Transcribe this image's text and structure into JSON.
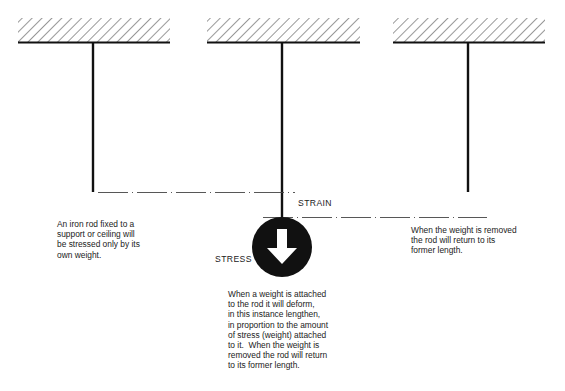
{
  "figure": {
    "panels": [
      {
        "id": "unloaded",
        "caption": "An iron rod fixed to a\nsupport or ceiling will\nbe stressed only by its\nown weight."
      },
      {
        "id": "loaded",
        "caption": "When a weight is attached\nto the rod it will deform,\nin this instance lengthen,\nin proportion to the amount\nof stress (weight) attached\nto it.  When the weight is\nremoved the rod will return\nto its former length."
      },
      {
        "id": "unloaded-after",
        "caption": "When the weight is removed\nthe rod will return to its\nformer length."
      }
    ],
    "labels": {
      "strain": "STRAIN",
      "stress": "STRESS"
    },
    "icons": {
      "weight": "down-arrow-in-circle-icon",
      "ceiling": "hatched-ceiling-icon"
    },
    "colors": {
      "ink": "#111111",
      "background": "#ffffff"
    }
  }
}
